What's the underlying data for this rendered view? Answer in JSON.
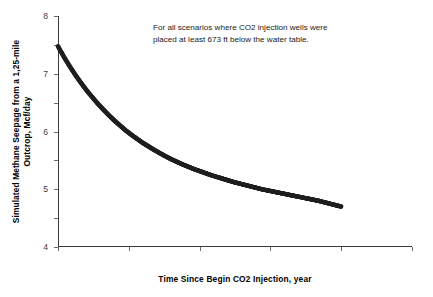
{
  "chart_data": {
    "type": "line",
    "title": "",
    "xlabel": "Time Since Begin CO2 Injection, year",
    "ylabel": "Simulated Methane Seepage from a 1,25-mile Outcrop, Mcf/day",
    "xlim": [
      0,
      250
    ],
    "ylim": [
      0,
      8
    ],
    "xticks": [
      0,
      50,
      100,
      150,
      200,
      250
    ],
    "yticks": [
      0,
      1,
      2,
      3,
      4,
      5,
      6,
      7,
      8
    ],
    "grid": false,
    "legend": false,
    "legend_position": "none",
    "marker_color": "#201f1f",
    "annotations": [
      {
        "line1": "For all scenarios where CO2 injection wells were",
        "line2": "placed at least 673 ft below the water table."
      }
    ],
    "series": [
      {
        "name": "Simulated methane seepage",
        "x": [
          0,
          4,
          8,
          12,
          16,
          20,
          24,
          28,
          32,
          36,
          40,
          44,
          48,
          52,
          56,
          60,
          64,
          68,
          72,
          76,
          80,
          84,
          88,
          92,
          96,
          100,
          104,
          108,
          112,
          116,
          120,
          124,
          128,
          132,
          136,
          140,
          144,
          148,
          152,
          156,
          160,
          164,
          168,
          172,
          176,
          180,
          184,
          188,
          192,
          196,
          200
        ],
        "y": [
          6.95,
          6.6,
          6.28,
          5.98,
          5.7,
          5.44,
          5.2,
          4.97,
          4.76,
          4.56,
          4.37,
          4.2,
          4.03,
          3.88,
          3.74,
          3.6,
          3.48,
          3.36,
          3.25,
          3.14,
          3.04,
          2.95,
          2.86,
          2.78,
          2.7,
          2.63,
          2.56,
          2.49,
          2.43,
          2.37,
          2.31,
          2.25,
          2.2,
          2.15,
          2.1,
          2.05,
          2.0,
          1.96,
          1.92,
          1.88,
          1.84,
          1.8,
          1.76,
          1.72,
          1.68,
          1.64,
          1.6,
          1.55,
          1.5,
          1.45,
          1.4
        ]
      }
    ]
  },
  "axis": {
    "x_title": "Time Since Begin CO2 Injection, year",
    "y_title_line1": "Simulated Methane Seepage from a 1,25-mile",
    "y_title_line2": "Outcrop, Mcf/day"
  }
}
